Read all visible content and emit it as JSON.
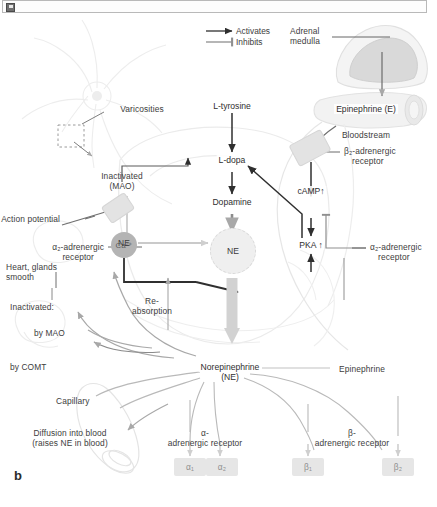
{
  "toolbar": {
    "icon": "image-placeholder-icon"
  },
  "panel": {
    "letter": "b"
  },
  "legend": {
    "activates": "Activates",
    "inhibits": "Inhibits"
  },
  "neuron": {
    "varicosities": "Varicosities",
    "action_potential": "Action potential",
    "reabsorption_line1": "Re-",
    "reabsorption_line2": "absorption",
    "calcium": "Ca²⁺",
    "ne_cytosol": "NE",
    "ne_vesicle": "NE"
  },
  "pathway": {
    "l_tyrosine": "L-tyrosine",
    "l_dopa": "L-dopa",
    "dopamine": "Dopamine",
    "norepinephrine_line1": "Norepinephrine",
    "norepinephrine_line2": "(NE)",
    "inactivated_line1": "Inactivated",
    "inactivated_line2": "(MAO)"
  },
  "signaling": {
    "camp": "cAMP↑",
    "pka": "PKA ↑"
  },
  "adrenal": {
    "medulla_line1": "Adrenal",
    "medulla_line2": "medulla",
    "epinephrine_e": "Epinephrine (E)",
    "bloodstream": "Bloodstream",
    "epinephrine": "Epinephrine"
  },
  "receptors": {
    "beta2_line1": "β₂-adrenergic",
    "beta2_line2": "receptor",
    "alpha2_right_line1": "α₂-adrenergic",
    "alpha2_right_line2": "receptor",
    "alpha2_left_line1": "α₂-adrenergic",
    "alpha2_left_line2": "receptor",
    "alpha2_left_line3": "Heart, glands",
    "alpha2_left_line4": "smooth",
    "alpha_group_line1": "α-",
    "alpha_group_line2": "adrenergic receptor",
    "beta_group_line1": "β-",
    "beta_group_line2": "adrenergic receptor",
    "alpha1": "α₁",
    "alpha2": "α₂",
    "beta1": "β₁",
    "beta2": "β₂"
  },
  "degradation": {
    "inactivated": "Inactivated:",
    "by_mao": "by MAO",
    "by_comt": "by COMT"
  },
  "capillary": {
    "label": "Capillary",
    "diffusion_line1": "Diffusion into blood",
    "diffusion_line2": "(raises NE in blood)"
  },
  "colors": {
    "ink": "#3d3d3d",
    "arrow_dark": "#2f2f2f",
    "arrow_gray": "#9a9a9a",
    "faint_outline": "#e6e6e6",
    "calcium_fill": "#b4b4b4",
    "receptor_fill": "#e3e3e3"
  }
}
